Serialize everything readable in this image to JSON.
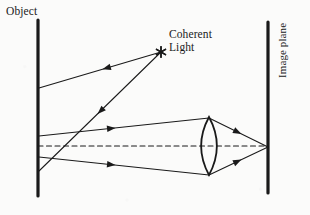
{
  "figure": {
    "background_color": "#fbfbfa",
    "ink_color": "#1a1a1a",
    "width": 310,
    "height": 215
  },
  "labels": {
    "object": "Object",
    "coherent_light_line1": "Coherent",
    "coherent_light_line2": "Light",
    "image_plane": "Image plane"
  },
  "diagram": {
    "object_plane": {
      "name": "object-plane-line",
      "x": 38,
      "y_top": 20,
      "y_bottom": 196,
      "stroke_width": 3.2
    },
    "image_plane": {
      "name": "image-plane-line",
      "x": 268,
      "y_top": 22,
      "y_bottom": 193,
      "stroke_width": 3.2
    },
    "source": {
      "name": "coherent-light-source",
      "x": 161,
      "y": 52,
      "glyph": "asterisk-star"
    },
    "lens": {
      "name": "biconvex-lens",
      "cx": 209,
      "cy": 146,
      "half_height": 29,
      "bulge": 7.5
    },
    "optical_axis": {
      "name": "optical-axis-dashed",
      "x1": 38,
      "y1": 146,
      "x2": 268,
      "y2": 146,
      "dash": "5,3.5"
    },
    "illumination_rays": [
      {
        "name": "illumination-ray-upper",
        "x1": 161,
        "y1": 52,
        "x2": 39,
        "y2": 88,
        "arrow_t": 0.48,
        "direction": "to-object"
      },
      {
        "name": "illumination-ray-lower",
        "x1": 161,
        "y1": 52,
        "x2": 39,
        "y2": 171,
        "arrow_t": 0.52,
        "direction": "to-object"
      }
    ],
    "scattered_rays": [
      {
        "name": "scattered-ray-upper-to-lens",
        "x1": 39,
        "y1": 136,
        "x2": 209,
        "y2": 118,
        "arrow_t": 0.45,
        "direction": "to-lens"
      },
      {
        "name": "scattered-ray-lower-to-lens",
        "x1": 39,
        "y1": 157,
        "x2": 209,
        "y2": 175,
        "arrow_t": 0.45,
        "direction": "to-lens"
      }
    ],
    "converging_rays": [
      {
        "name": "converging-ray-upper",
        "x1": 209,
        "y1": 118,
        "x2": 268,
        "y2": 147,
        "arrow_t": 0.55,
        "direction": "to-image"
      },
      {
        "name": "converging-ray-lower",
        "x1": 209,
        "y1": 175,
        "x2": 268,
        "y2": 147,
        "arrow_t": 0.55,
        "direction": "to-image"
      }
    ],
    "image_point": {
      "name": "image-focus-point",
      "x": 268,
      "y": 147
    }
  }
}
